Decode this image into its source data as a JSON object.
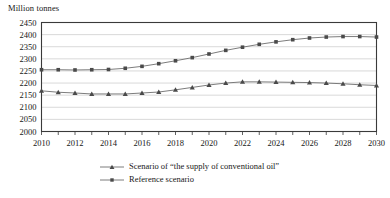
{
  "chart_data": {
    "type": "line",
    "title": "",
    "ylabel": "Million tonnes",
    "xlabel": "",
    "ylim": [
      2000,
      2450
    ],
    "ytick_step": 50,
    "yticks": [
      2000,
      2050,
      2100,
      2150,
      2200,
      2250,
      2300,
      2350,
      2400,
      2450
    ],
    "xlim": [
      2010,
      2030
    ],
    "xticks": [
      2010,
      2012,
      2014,
      2016,
      2018,
      2020,
      2022,
      2024,
      2026,
      2028,
      2030
    ],
    "x": [
      2010,
      2011,
      2012,
      2013,
      2014,
      2015,
      2016,
      2017,
      2018,
      2019,
      2020,
      2021,
      2022,
      2023,
      2024,
      2025,
      2026,
      2027,
      2028,
      2029,
      2030
    ],
    "grid": "horizontal",
    "legend_position": "bottom",
    "series": [
      {
        "name": "Scenario of “the supply of conventional oil”",
        "marker": "triangle",
        "values": [
          2168,
          2162,
          2159,
          2155,
          2155,
          2155,
          2159,
          2163,
          2172,
          2182,
          2192,
          2200,
          2205,
          2205,
          2204,
          2203,
          2202,
          2200,
          2197,
          2193,
          2190
        ]
      },
      {
        "name": "Reference scenario",
        "marker": "square",
        "values": [
          2255,
          2255,
          2254,
          2255,
          2256,
          2261,
          2269,
          2280,
          2292,
          2305,
          2320,
          2335,
          2348,
          2360,
          2370,
          2379,
          2386,
          2390,
          2392,
          2392,
          2390
        ]
      }
    ]
  },
  "legend": {
    "items": [
      {
        "label": "Scenario of “the supply of conventional oil”",
        "marker": "triangle"
      },
      {
        "label": "Reference scenario",
        "marker": "square"
      }
    ]
  },
  "colors": {
    "line": "#6d6d6d",
    "marker": "#4a4a4a",
    "grid": "#c9c9c9",
    "frame": "#3a3a3a",
    "text": "#171717"
  }
}
